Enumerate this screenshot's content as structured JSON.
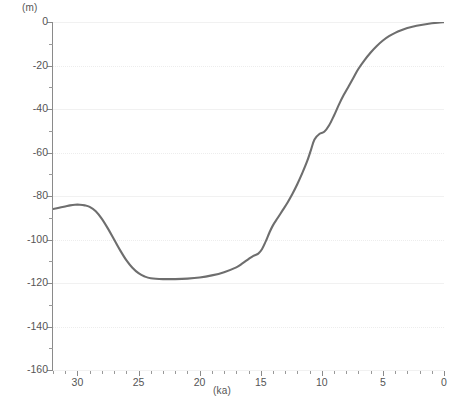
{
  "chart_data": {
    "type": "line",
    "title": "",
    "subtitle": "",
    "xlabel": "(ka)",
    "ylabel": "(m)",
    "x_unit_caption": "(ka)",
    "y_unit_caption": "(m)",
    "xlim": [
      32,
      0
    ],
    "ylim": [
      -160,
      0
    ],
    "x_reversed": true,
    "grid": "horizontal-dotted-faint",
    "legend": "none",
    "x_ticks_major": [
      30,
      25,
      20,
      15,
      10,
      5,
      0
    ],
    "x_ticks_major_labels": [
      "30",
      "25",
      "20",
      "15",
      "10",
      "5",
      "0"
    ],
    "x_tick_minor_step": 1,
    "y_ticks_major": [
      0,
      -20,
      -40,
      -60,
      -80,
      -100,
      -120,
      -140,
      -160
    ],
    "y_ticks_major_labels": [
      "0",
      "-20",
      "-40",
      "-60",
      "-80",
      "-100",
      "-120",
      "-140",
      "-160"
    ],
    "y_tick_minor_step": 10,
    "series": [
      {
        "name": "relative-sea-level",
        "color": "#6e6e6e",
        "x": [
          32.0,
          31.5,
          31.0,
          30.6,
          30.2,
          29.8,
          29.4,
          29.0,
          28.5,
          28.0,
          27.5,
          27.0,
          26.5,
          26.0,
          25.5,
          25.0,
          24.5,
          24.0,
          23.0,
          22.0,
          21.0,
          20.0,
          19.0,
          18.0,
          17.0,
          16.5,
          16.0,
          15.6,
          15.2,
          14.9,
          14.6,
          14.3,
          14.0,
          13.6,
          13.2,
          12.8,
          12.4,
          12.0,
          11.6,
          11.2,
          10.9,
          10.6,
          10.2,
          9.8,
          9.4,
          9.0,
          8.6,
          8.2,
          7.8,
          7.4,
          7.0,
          6.5,
          6.0,
          5.5,
          5.0,
          4.5,
          4.0,
          3.5,
          3.0,
          2.5,
          2.0,
          1.5,
          1.0,
          0.5,
          0.0
        ],
        "y": [
          -86.0,
          -85.4,
          -84.8,
          -84.3,
          -84.0,
          -84.0,
          -84.3,
          -85.0,
          -87.0,
          -90.5,
          -95.0,
          -100.0,
          -105.0,
          -109.5,
          -113.0,
          -115.5,
          -117.0,
          -117.8,
          -118.2,
          -118.2,
          -118.0,
          -117.5,
          -116.5,
          -115.0,
          -112.8,
          -111.0,
          -109.0,
          -107.5,
          -106.5,
          -104.5,
          -101.0,
          -97.0,
          -93.5,
          -90.0,
          -86.5,
          -83.0,
          -79.0,
          -74.5,
          -69.5,
          -64.0,
          -59.0,
          -54.0,
          -51.5,
          -50.5,
          -47.5,
          -43.0,
          -38.0,
          -33.5,
          -29.5,
          -25.5,
          -21.5,
          -17.5,
          -14.0,
          -11.0,
          -8.5,
          -6.5,
          -5.0,
          -3.8,
          -2.8,
          -2.1,
          -1.5,
          -1.0,
          -0.6,
          -0.3,
          -0.1
        ],
        "annotations": [
          {
            "label": "pre-LGM shoulder",
            "x": 30.2,
            "y": -84.0
          },
          {
            "label": "LGM lowstand",
            "x": 22.5,
            "y": -118.2
          },
          {
            "label": "meltwater pulse step",
            "x": 14.7,
            "y": -104.0
          },
          {
            "label": "Younger Dryas slowdown",
            "x": 10.4,
            "y": -51.0
          },
          {
            "label": "Holocene plateau",
            "x": 1.0,
            "y": -0.6
          }
        ]
      }
    ]
  },
  "axes": {
    "y_caption": "(m)",
    "x_caption": "(ka)",
    "y_labels": [
      "0",
      "-20",
      "-40",
      "-60",
      "-80",
      "-100",
      "-120",
      "-140",
      "-160"
    ],
    "x_labels": [
      "30",
      "25",
      "20",
      "15",
      "10",
      "5",
      "0"
    ]
  },
  "colors": {
    "curve": "#6e6e6e",
    "axis": "#8a8a8a",
    "grid": "#ededed",
    "text": "#555555",
    "background": "#ffffff"
  }
}
